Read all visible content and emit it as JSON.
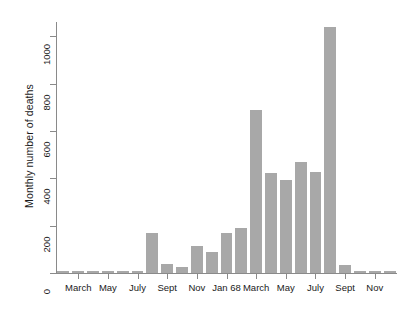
{
  "chart_data": {
    "type": "bar",
    "title": "",
    "xlabel": "",
    "ylabel": "Monthly number of deaths",
    "ylim": [
      0,
      1060
    ],
    "yticks": [
      0,
      200,
      400,
      600,
      800,
      1000
    ],
    "ytick_labels": [
      "0",
      "200",
      "400",
      "600",
      "800",
      "1000"
    ],
    "grid": false,
    "legend": null,
    "bar_color": "#a8a8a8",
    "axis_color": "#8a8a8a",
    "categories": [
      "Feb",
      "March",
      "April",
      "May",
      "June",
      "July",
      "Aug",
      "Sept",
      "Oct",
      "Nov",
      "Dec",
      "Jan 68",
      "Feb",
      "March",
      "April",
      "May",
      "June",
      "July",
      "Aug",
      "Sept",
      "Oct",
      "Nov",
      "Dec"
    ],
    "values": [
      4,
      4,
      3,
      4,
      3,
      2,
      167,
      38,
      25,
      113,
      88,
      167,
      188,
      688,
      421,
      392,
      467,
      425,
      1040,
      33,
      4,
      4,
      4
    ],
    "visible_xtick_labels": [
      "March",
      "May",
      "July",
      "Sept",
      "Nov",
      "Jan 68",
      "March",
      "May",
      "July",
      "Sept",
      "Nov"
    ],
    "visible_xtick_indices": [
      1,
      3,
      5,
      7,
      9,
      11,
      13,
      15,
      17,
      19,
      21
    ]
  }
}
